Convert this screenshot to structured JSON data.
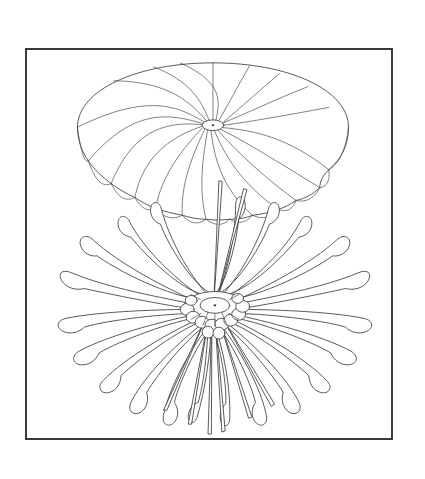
{
  "page": {
    "background_color": "#ffffff",
    "width": 425,
    "height": 479,
    "caption": ""
  },
  "frame": {
    "border_color": "#3a3a3c",
    "border_width_px": 2,
    "fill_color": "#ffffff",
    "x": 25,
    "y": 48,
    "width": 368,
    "height": 392
  },
  "line_art": {
    "stroke_color": "#3c3c3e",
    "fill_color": "#ffffff",
    "style": "patent-line-drawing"
  },
  "figures": [
    {
      "id": "inflated-canopy",
      "label": "Inflated parachute canopy, perspective view",
      "center_x": 188,
      "center_y": 76,
      "apex_x": 188,
      "apex_y": 76,
      "radius_x": 137,
      "radius_y": 60,
      "gore_count": 20,
      "vent_rx": 10,
      "vent_ry": 5,
      "skirt_drop": 54
    },
    {
      "id": "spread-canopy",
      "label": "Deflated canopy with radiating gores, plan view",
      "center_x": 190,
      "center_y": 260,
      "hub_rx": 15,
      "hub_ry": 8,
      "petal_count": 20,
      "petal_length": 140,
      "suspension_line_count": 5
    }
  ]
}
